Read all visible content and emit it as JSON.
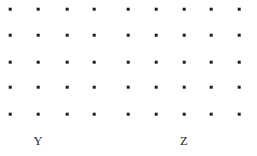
{
  "figure": {
    "kind": "dot-grid",
    "width": 257,
    "height": 156,
    "background_color": "#ffffff",
    "dot_color": "#1d1d1d",
    "dot_size_px": 2.6,
    "label_color": "#1f1f1f",
    "rows": 5,
    "columns": 9,
    "column_x": [
      10,
      38,
      67,
      94,
      128,
      156,
      184,
      211,
      239
    ],
    "row_y": [
      9,
      35,
      62,
      87,
      114
    ]
  },
  "chart_data": {
    "type": "scatter",
    "title": "",
    "subtitle": "",
    "xlabel": "",
    "ylabel": "",
    "grid": false,
    "legend": "none",
    "xlim": [
      0,
      257
    ],
    "ylim": [
      0,
      156
    ],
    "series": [
      {
        "name": "grid-points",
        "marker": "square",
        "color": "#1d1d1d",
        "x": [
          10,
          38,
          67,
          94,
          128,
          156,
          184,
          211,
          239,
          10,
          38,
          67,
          94,
          128,
          156,
          184,
          211,
          239,
          10,
          38,
          67,
          94,
          128,
          156,
          184,
          211,
          239,
          10,
          38,
          67,
          94,
          128,
          156,
          184,
          211,
          239,
          10,
          38,
          67,
          94,
          128,
          156,
          184,
          211,
          239
        ],
        "y": [
          9,
          9,
          9,
          9,
          9,
          9,
          9,
          9,
          9,
          35,
          35,
          35,
          35,
          35,
          35,
          35,
          35,
          35,
          62,
          62,
          62,
          62,
          62,
          62,
          62,
          62,
          62,
          87,
          87,
          87,
          87,
          87,
          87,
          87,
          87,
          87,
          114,
          114,
          114,
          114,
          114,
          114,
          114,
          114,
          114
        ]
      }
    ],
    "annotations": [
      {
        "text": "Y",
        "x": 38,
        "y": 147
      },
      {
        "text": "Z",
        "x": 184,
        "y": 147
      }
    ]
  },
  "labels": {
    "items": [
      {
        "text": "Y",
        "x": 38,
        "y": 147,
        "name": "axis-label-y"
      },
      {
        "text": "Z",
        "x": 184,
        "y": 147,
        "name": "axis-label-z"
      }
    ]
  }
}
